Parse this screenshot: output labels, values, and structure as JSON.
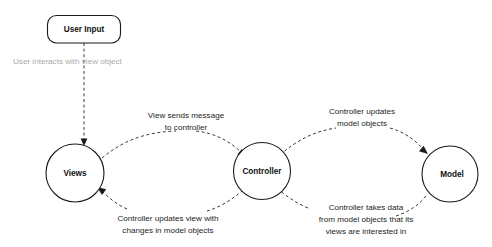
{
  "diagram": {
    "background_color": "#ffffff",
    "node_stroke_color": "#1b1b1b",
    "edge_stroke_color": "#3a3a3a",
    "label_color": "#242424",
    "faded_label_color": "#a9aaac",
    "nodes": {
      "user_input": {
        "label": "User Input",
        "shape": "rounded-rect"
      },
      "views": {
        "label": "Views",
        "shape": "circle"
      },
      "controller": {
        "label": "Controller",
        "shape": "circle"
      },
      "model": {
        "label": "Model",
        "shape": "circle"
      }
    },
    "edge_labels": {
      "user_interacts": {
        "line1": "User interacts with view object"
      },
      "view_sends": {
        "line1": "View sends message",
        "line2": "to controller"
      },
      "controller_updates_model": {
        "line1": "Controller updates",
        "line2": "model objects"
      },
      "controller_updates_view": {
        "line1": "Controller updates view with",
        "line2": "changes in model objects"
      },
      "controller_takes_data": {
        "line1": "Controller takes data",
        "line2": "from model objects that its",
        "line3": "views are interested in"
      }
    }
  }
}
